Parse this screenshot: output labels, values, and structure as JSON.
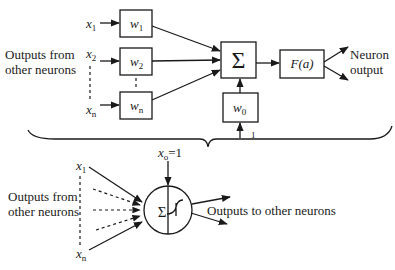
{
  "top_diagram": {
    "inputs_label_line1": "Outputs from",
    "inputs_label_line2": "other neurons",
    "inputs": [
      {
        "var": "x",
        "sub": "1"
      },
      {
        "var": "x",
        "sub": "2"
      },
      {
        "var": "x",
        "sub": "n"
      }
    ],
    "weights": [
      {
        "var": "w",
        "sub": "1"
      },
      {
        "var": "w",
        "sub": "2"
      },
      {
        "var": "w",
        "sub": "n"
      }
    ],
    "summation_symbol": "Σ",
    "bias_weight": {
      "var": "w",
      "sub": "0"
    },
    "bias_input": "1",
    "activation_label": "F(a)",
    "output_label_line1": "Neuron",
    "output_label_line2": "output"
  },
  "bottom_diagram": {
    "inputs_label_line1": "Outputs from",
    "inputs_label_line2": "other neurons",
    "inputs": [
      {
        "var": "x",
        "sub": "1"
      },
      {
        "var": "x",
        "sub": "n"
      }
    ],
    "bias_label": {
      "var": "x",
      "sub": "o",
      "value": "=1"
    },
    "summation_symbol": "Σ",
    "output_label": "Outputs to other neurons"
  }
}
